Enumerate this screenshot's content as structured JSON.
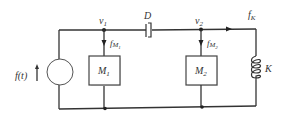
{
  "diagram": {
    "type": "mechanical-system-circuit-analog",
    "source": {
      "label": "f(t)",
      "direction": "up"
    },
    "nodes": [
      {
        "id": "v1",
        "label": "v",
        "subscript": "1"
      },
      {
        "id": "v2",
        "label": "v",
        "subscript": "2"
      }
    ],
    "damper": {
      "label": "D"
    },
    "masses": [
      {
        "id": "M1",
        "label": "M",
        "subscript": "1",
        "force_label": "f",
        "force_sub": "M",
        "force_subsub": "1"
      },
      {
        "id": "M2",
        "label": "M",
        "subscript": "2",
        "force_label": "f",
        "force_sub": "M",
        "force_subsub": "2"
      }
    ],
    "spring": {
      "label": "K",
      "force_label": "f",
      "force_sub": "K"
    },
    "colors": {
      "line": "#333333",
      "background": "#ffffff"
    }
  }
}
